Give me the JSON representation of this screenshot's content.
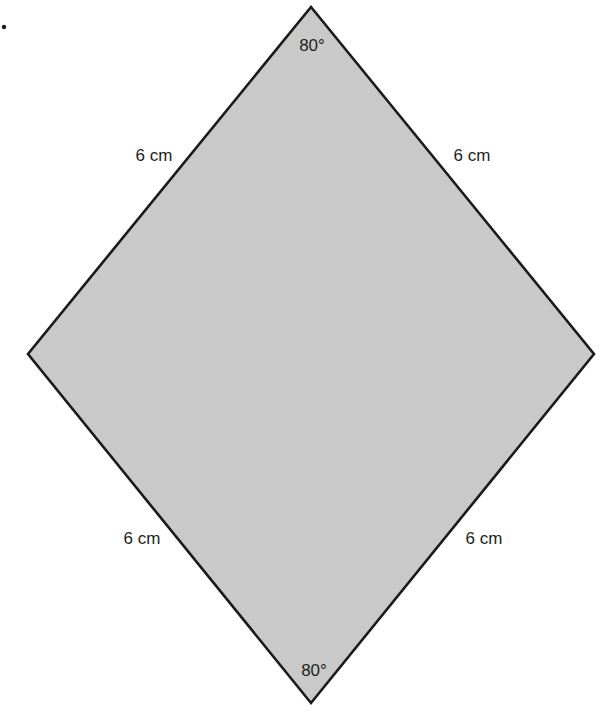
{
  "figure": {
    "marker": ".",
    "shape": "rhombus",
    "fill_color": "#c8c9c8",
    "stroke_color": "#1a1a1a",
    "vertices": {
      "top": [
        311,
        7
      ],
      "right": [
        594,
        354
      ],
      "bottom": [
        311,
        703
      ],
      "left": [
        28,
        354
      ]
    },
    "angles": {
      "top": "80°",
      "bottom": "80°"
    },
    "sides": {
      "top_left": "6 cm",
      "top_right": "6 cm",
      "bottom_left": "6 cm",
      "bottom_right": "6 cm"
    }
  }
}
